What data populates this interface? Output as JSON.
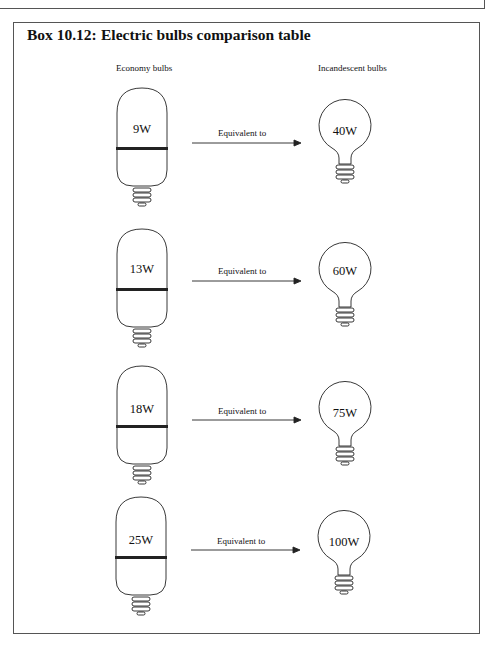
{
  "box": {
    "number": "Box 10.12:",
    "title": "Electric bulbs comparison table"
  },
  "columns": {
    "economy": "Economy bulbs",
    "incandescent": "Incandescent bulbs"
  },
  "rows": [
    {
      "economy": "9W",
      "relation": "Equivalent to",
      "incandescent": "40W"
    },
    {
      "economy": "13W",
      "relation": "Equivalent to",
      "incandescent": "60W"
    },
    {
      "economy": "18W",
      "relation": "Equivalent to",
      "incandescent": "75W"
    },
    {
      "economy": "25W",
      "relation": "Equivalent to",
      "incandescent": "100W"
    }
  ],
  "colors": {
    "line": "#222222",
    "frame": "#555555",
    "background": "#ffffff"
  }
}
